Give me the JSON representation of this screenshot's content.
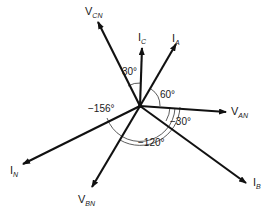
{
  "diagram": {
    "type": "phasor",
    "center": [
      140,
      106
    ],
    "colors": {
      "line": "#111111",
      "background": "#ffffff",
      "text": "#1a1a1a"
    },
    "phasors": [
      {
        "id": "V_AN",
        "main": "V",
        "sub": "AN",
        "tip": [
          226,
          112
        ],
        "label_pos": [
          231,
          115
        ]
      },
      {
        "id": "I_A",
        "main": "I",
        "sub": "A",
        "tip": [
          176,
          44
        ],
        "label_pos": [
          172,
          42
        ]
      },
      {
        "id": "I_C",
        "main": "I",
        "sub": "C",
        "tip": [
          142,
          48
        ],
        "label_pos": [
          138,
          41
        ]
      },
      {
        "id": "V_CN",
        "main": "V",
        "sub": "CN",
        "tip": [
          98,
          22
        ],
        "label_pos": [
          85,
          15
        ]
      },
      {
        "id": "I_N",
        "main": "I",
        "sub": "N",
        "tip": [
          23,
          164
        ],
        "label_pos": [
          10,
          174
        ]
      },
      {
        "id": "V_BN",
        "main": "V",
        "sub": "BN",
        "tip": [
          92,
          187
        ],
        "label_pos": [
          78,
          203
        ]
      },
      {
        "id": "I_B",
        "main": "I",
        "sub": "B",
        "tip": [
          246,
          183
        ],
        "label_pos": [
          253,
          186
        ]
      }
    ],
    "angles": [
      {
        "label": "30°",
        "pos": [
          125,
          73
        ]
      },
      {
        "label": "60°",
        "pos": [
          160,
          98
        ]
      },
      {
        "label": "−30°",
        "pos": [
          221,
          125
        ]
      },
      {
        "label": "−156°",
        "pos": [
          89,
          111
        ]
      },
      {
        "label": "−120°",
        "pos": [
          140,
          145
        ]
      }
    ]
  }
}
